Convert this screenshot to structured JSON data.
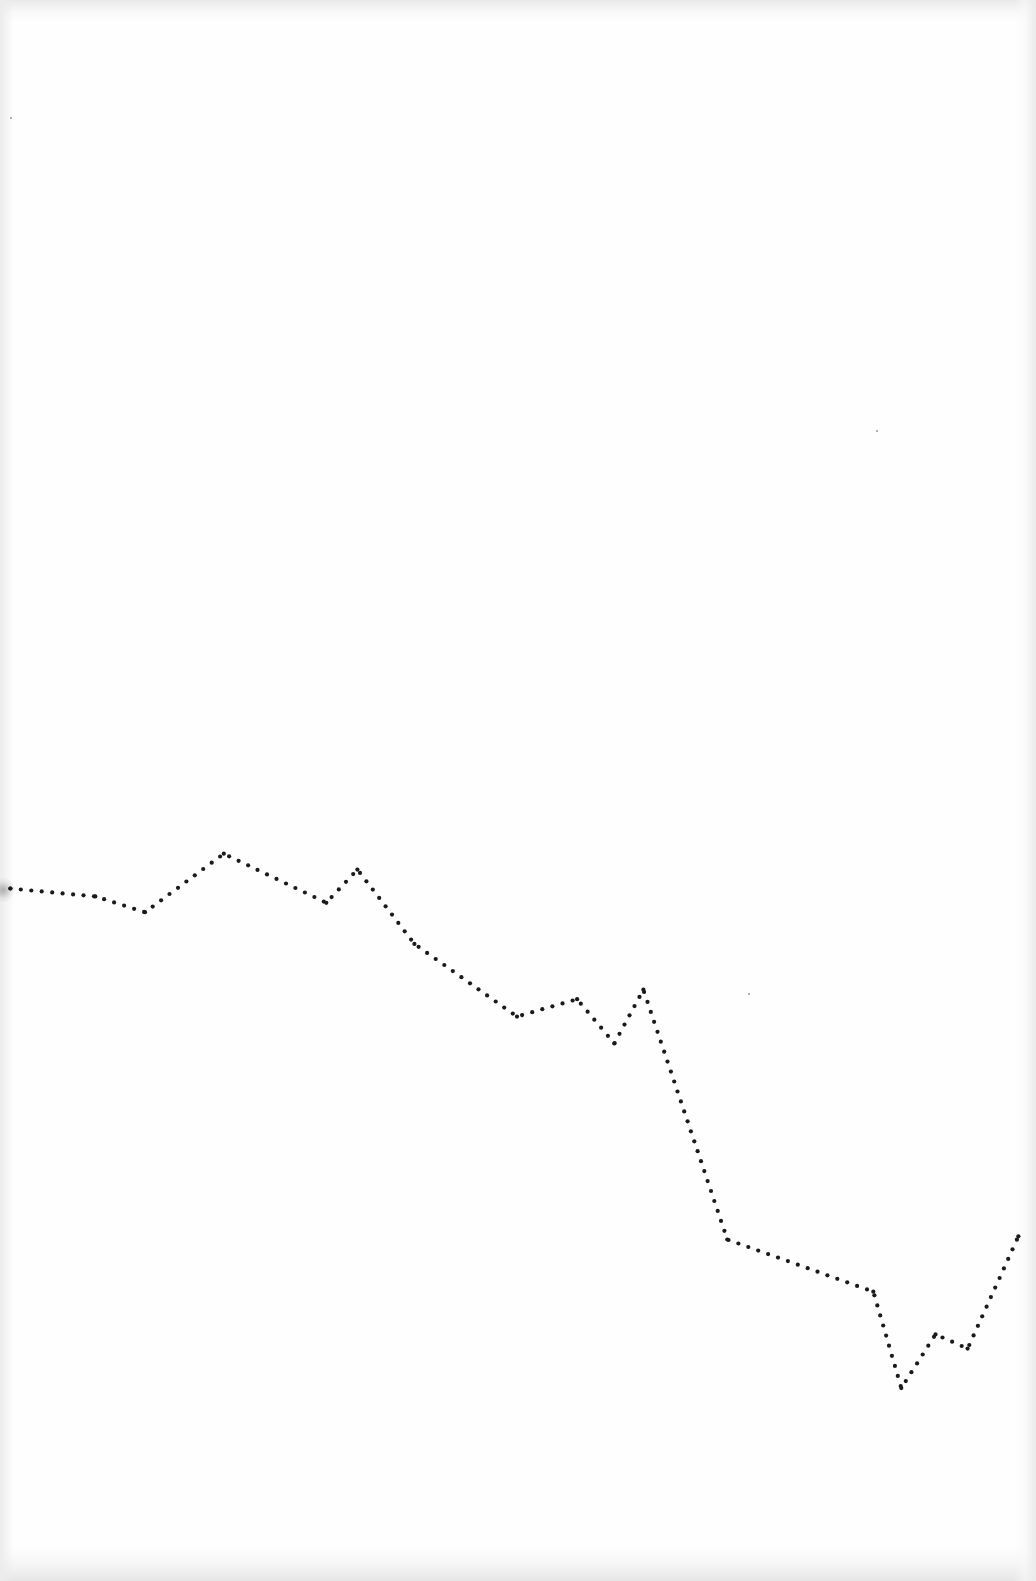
{
  "page": {
    "kind": "scanned page with hand-drawn dotted line",
    "background_color": "#fefefe",
    "ink_color": "#1a1a1a"
  },
  "sketch": {
    "description": "dotted polyline trending downward left to right",
    "style": "dotted",
    "x_range": [
      0,
      1
    ],
    "y_range": [
      0,
      1
    ],
    "y_axis_note": "y measured downward as fraction of page height",
    "vertices": [
      {
        "x": 0.01,
        "y": 0.562
      },
      {
        "x": 0.092,
        "y": 0.567
      },
      {
        "x": 0.14,
        "y": 0.577
      },
      {
        "x": 0.216,
        "y": 0.54
      },
      {
        "x": 0.315,
        "y": 0.571
      },
      {
        "x": 0.345,
        "y": 0.55
      },
      {
        "x": 0.4,
        "y": 0.597
      },
      {
        "x": 0.499,
        "y": 0.643
      },
      {
        "x": 0.557,
        "y": 0.632
      },
      {
        "x": 0.593,
        "y": 0.66
      },
      {
        "x": 0.621,
        "y": 0.626
      },
      {
        "x": 0.702,
        "y": 0.784
      },
      {
        "x": 0.843,
        "y": 0.817
      },
      {
        "x": 0.87,
        "y": 0.878
      },
      {
        "x": 0.903,
        "y": 0.844
      },
      {
        "x": 0.934,
        "y": 0.853
      },
      {
        "x": 0.983,
        "y": 0.782
      }
    ]
  },
  "specks": [
    {
      "x": 0.01,
      "y": 0.074
    },
    {
      "x": 0.846,
      "y": 0.272
    },
    {
      "x": 0.722,
      "y": 0.628
    }
  ]
}
